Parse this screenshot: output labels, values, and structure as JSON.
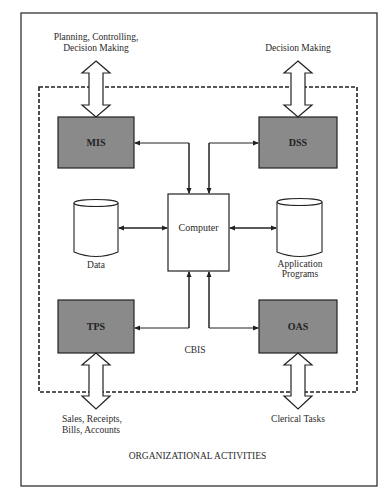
{
  "diagram": {
    "frame_label": "ORGANIZATIONAL ACTIVITIES",
    "boundary_label": "CBIS",
    "top_left_label": [
      "Planning, Controlling,",
      "Decision Making"
    ],
    "top_right_label": "Decision Making",
    "bottom_left_label": [
      "Sales, Receipts,",
      "Bills, Accounts"
    ],
    "bottom_right_label": "Clerical Tasks",
    "nodes": {
      "mis": "MIS",
      "dss": "DSS",
      "tps": "TPS",
      "oas": "OAS",
      "computer": "Computer",
      "data": "Data",
      "app_programs": [
        "Application",
        "Programs"
      ]
    },
    "colors": {
      "subsystem_fill": "#8a8a8a",
      "line": "#222222"
    }
  }
}
